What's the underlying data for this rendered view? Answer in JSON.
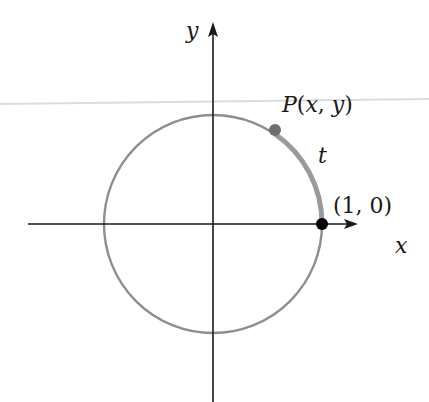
{
  "diagram": {
    "axes": {
      "x_label": "x",
      "y_label": "y"
    },
    "points": [
      {
        "label": "P(x, y)",
        "role": "terminal point",
        "color": "#707070"
      },
      {
        "label": "(1, 0)",
        "role": "initial point",
        "color": "#000000"
      }
    ],
    "arc": {
      "label": "t",
      "color": "#9a9a9a"
    },
    "circle": {
      "color": "#8c8c8c",
      "radius": 1
    }
  },
  "labels": {
    "y_axis": "y",
    "x_axis": "x",
    "point_p": "P(x, y)",
    "arc_t": "t",
    "point_start": "(1, 0)"
  }
}
